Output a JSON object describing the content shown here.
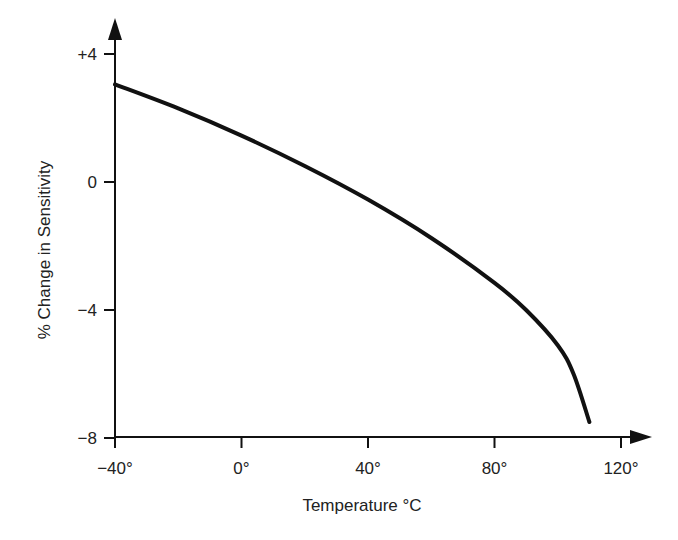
{
  "chart_data": {
    "type": "line",
    "title": "",
    "xlabel": "Temperature °C",
    "ylabel": "% Change in Sensitivity",
    "x_ticks": [
      "−40°",
      "0°",
      "40°",
      "80°",
      "120°"
    ],
    "x_tick_values": [
      -40,
      0,
      40,
      80,
      120
    ],
    "y_ticks": [
      "+4",
      "0",
      "−4",
      "−8"
    ],
    "y_tick_values": [
      4,
      0,
      -4,
      -8
    ],
    "xlim": [
      -40,
      125
    ],
    "ylim": [
      -8,
      5
    ],
    "grid": false,
    "legend": null,
    "series": [
      {
        "name": "Sensitivity change",
        "x": [
          -40,
          -20,
          0,
          20,
          40,
          60,
          80,
          90,
          100,
          105,
          110
        ],
        "y": [
          3.05,
          2.3,
          1.45,
          0.5,
          -0.55,
          -1.75,
          -3.15,
          -4.0,
          -5.1,
          -6.0,
          -7.5
        ]
      }
    ],
    "line_color": "#111111"
  }
}
